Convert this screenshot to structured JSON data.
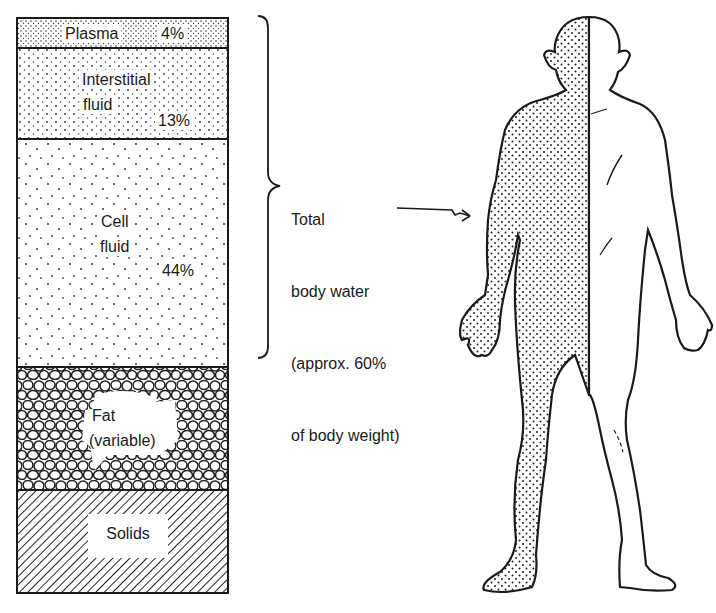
{
  "diagram": {
    "column": {
      "segments": [
        {
          "id": "plasma",
          "label": "Plasma",
          "value": "4%",
          "pattern": "dense-stipple"
        },
        {
          "id": "interstitial",
          "label_line1": "Interstitial",
          "label_line2": "fluid",
          "value": "13%",
          "pattern": "medium-stipple"
        },
        {
          "id": "cell",
          "label_line1": "Cell",
          "label_line2": "fluid",
          "value": "44%",
          "pattern": "sparse-stipple"
        },
        {
          "id": "fat",
          "label_line1": "Fat",
          "label_line2": "(variable)",
          "pattern": "cells"
        },
        {
          "id": "solids",
          "label": "Solids",
          "pattern": "diagonal-hatch"
        }
      ]
    },
    "bracket": {
      "label_line1": "Total",
      "label_line2": "body water",
      "label_line3": "(approx. 60%",
      "label_line4": "of body weight)"
    },
    "figure": {
      "description": "Human figure, left half stippled (water), right half outline",
      "arrow_target": "stippled-body-half"
    },
    "colors": {
      "ink": "#1a1a1a",
      "paper": "#ffffff"
    }
  }
}
